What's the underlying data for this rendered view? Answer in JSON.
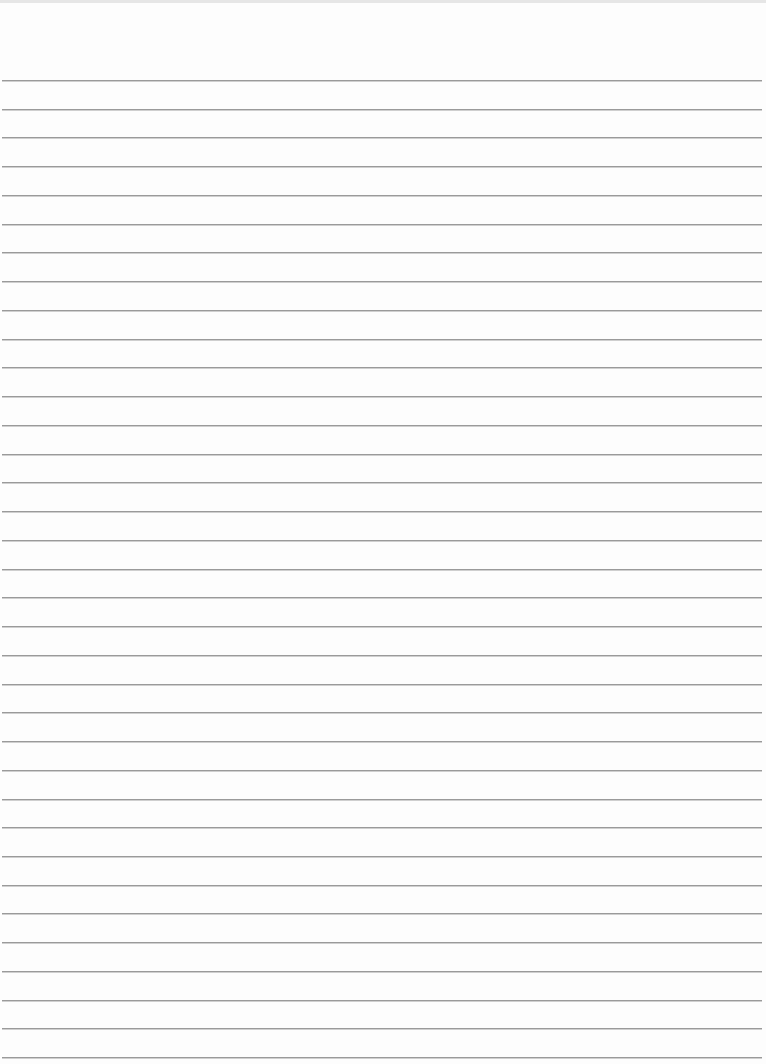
{
  "paper": {
    "type": "lined-paper",
    "line_count": 35,
    "first_line_y": 80,
    "line_spacing": 28.74,
    "line_color": "#9a9a9a",
    "background_color": "#fdfdfd"
  }
}
